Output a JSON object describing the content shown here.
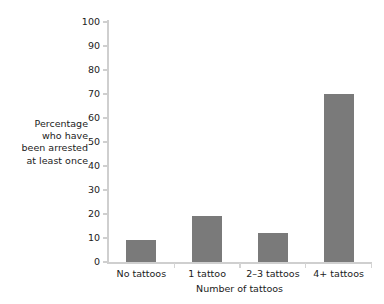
{
  "chart_data": {
    "type": "bar",
    "title": "",
    "subtitle": "",
    "categories": [
      "No tattoos",
      "1 tattoo",
      "2–3 tattoos",
      "4+ tattoos"
    ],
    "values": [
      9,
      19,
      12,
      70
    ],
    "xlabel": "Number of tattoos",
    "ylabel": "Percentage who have been arrested at least once",
    "ylabel_lines": [
      "Percentage",
      "who have",
      "been arrested",
      "at least once"
    ],
    "ylim": [
      0,
      100
    ],
    "ytick_values": [
      0,
      10,
      20,
      30,
      40,
      50,
      60,
      70,
      80,
      90,
      100
    ],
    "ytick_labels": [
      "0",
      "10",
      "20",
      "30",
      "40",
      "50",
      "60",
      "70",
      "80",
      "90",
      "100"
    ],
    "ytick_step": 10,
    "grid": false,
    "legend": false,
    "legend_position": "none",
    "bar_color": "#7a7a7a",
    "axis_color": "#cfcfcf",
    "background_color": "#ffffff",
    "text_color": "#1b1b1b",
    "series": [
      {
        "name": "Percentage arrested at least once",
        "values": [
          9,
          19,
          12,
          70
        ]
      }
    ]
  }
}
